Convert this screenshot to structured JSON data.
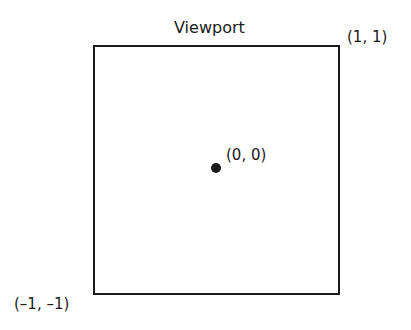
{
  "diagram": {
    "title": "Viewport",
    "corners": {
      "top_right": "(1, 1)",
      "bottom_left": "(–1, –1)"
    },
    "center": "(0, 0)",
    "colors": {
      "stroke": "#1a1a1a",
      "background": "#ffffff"
    }
  }
}
